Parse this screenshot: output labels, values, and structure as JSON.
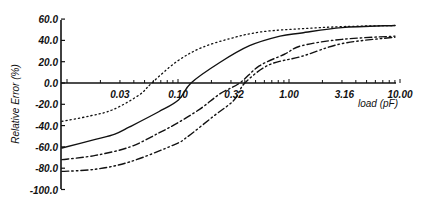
{
  "chart_data": {
    "type": "line",
    "title": "",
    "xlabel": "load (pF)",
    "ylabel": "Relative Error (%)",
    "xscale": "log",
    "xlim": [
      0.009,
      10.0
    ],
    "ylim": [
      -100,
      60
    ],
    "grid": false,
    "legend": null,
    "x_tick_labels": [
      "0.03",
      "0.10",
      "0.32",
      "1.00",
      "3.16",
      "10.00"
    ],
    "x_tick_values": [
      0.03,
      0.1,
      0.32,
      1.0,
      3.16,
      10.0
    ],
    "y_tick_labels": [
      "60.0",
      "40.0",
      "20.0",
      "0.0",
      "-20.0",
      "-40.0",
      "-60.0",
      "-80.0",
      "-100.0"
    ],
    "y_tick_values": [
      60,
      40,
      20,
      0,
      -20,
      -40,
      -60,
      -80,
      -100
    ],
    "series": [
      {
        "name": "dotted",
        "style": "dotted",
        "x": [
          0.009,
          0.016,
          0.026,
          0.045,
          0.058,
          0.097,
          0.162,
          0.302,
          0.56,
          1.3,
          3.16,
          9.0
        ],
        "y": [
          -36,
          -31,
          -25,
          -11,
          0,
          20,
          33,
          42,
          48,
          51,
          53,
          54
        ]
      },
      {
        "name": "solid",
        "style": "solid",
        "x": [
          0.009,
          0.018,
          0.027,
          0.037,
          0.067,
          0.101,
          0.131,
          0.236,
          0.441,
          0.83,
          1.3,
          3.0,
          9.0
        ],
        "y": [
          -61,
          -53,
          -48,
          -41,
          -27,
          -16,
          0,
          19,
          35,
          44,
          47,
          52,
          54
        ]
      },
      {
        "name": "dash-dot",
        "style": "dash-dot",
        "x": [
          0.009,
          0.018,
          0.037,
          0.067,
          0.101,
          0.16,
          0.24,
          0.36,
          0.54,
          0.91,
          1.3,
          3.0,
          9.0
        ],
        "y": [
          -72,
          -68,
          -60,
          -47,
          -37,
          -24,
          -10,
          0,
          16,
          27,
          35,
          41,
          44
        ]
      },
      {
        "name": "dash-dot-dot",
        "style": "dash-dot-dot",
        "x": [
          0.009,
          0.018,
          0.037,
          0.092,
          0.12,
          0.21,
          0.32,
          0.4,
          0.66,
          1.3,
          3.0,
          9.0
        ],
        "y": [
          -83,
          -81,
          -74,
          -58,
          -51,
          -31,
          -16,
          0,
          17,
          25,
          37,
          43
        ]
      }
    ]
  },
  "layout": {
    "plot_left": 61,
    "x_px_at_log0": 289,
    "px_per_decade": 111,
    "y_px_at_0": 83,
    "px_per_unit_y": 1.065,
    "x_axis_end": 396,
    "y_top": 20,
    "y_bottom": 189
  },
  "colors": {
    "ink": "#111111",
    "background": "#ffffff"
  }
}
